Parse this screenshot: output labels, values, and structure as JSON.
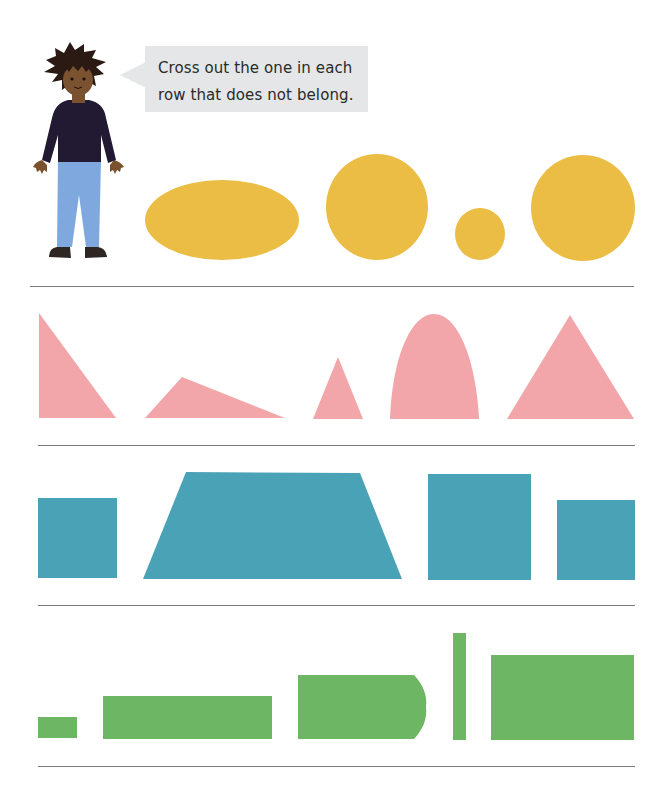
{
  "instruction": {
    "line1": "Cross out the one in each",
    "line2": "row that does not belong."
  },
  "colors": {
    "yellow": "#ebbd45",
    "pink": "#f2a6aa",
    "teal": "#4aa2b6",
    "green": "#6db664",
    "bubble": "#e4e6e8",
    "divider": "#7a7a7a",
    "character_hair": "#2b1a14",
    "character_skin": "#7a5230",
    "character_shirt": "#221932",
    "character_pants": "#7ea8de",
    "character_shoes": "#2e2622"
  },
  "rows": [
    {
      "name": "ovals-and-circles",
      "color": "yellow",
      "shapes": [
        "ellipse",
        "circle",
        "small-circle",
        "circle"
      ]
    },
    {
      "name": "triangles",
      "color": "pink",
      "shapes": [
        "right-triangle",
        "obtuse-triangle",
        "small-triangle",
        "arch",
        "triangle"
      ]
    },
    {
      "name": "squares",
      "color": "teal",
      "shapes": [
        "square",
        "trapezoid",
        "square",
        "square"
      ]
    },
    {
      "name": "rectangles",
      "color": "green",
      "shapes": [
        "small-rectangle",
        "long-rectangle",
        "rounded-end-rectangle",
        "tall-thin-rectangle",
        "rectangle"
      ]
    }
  ]
}
